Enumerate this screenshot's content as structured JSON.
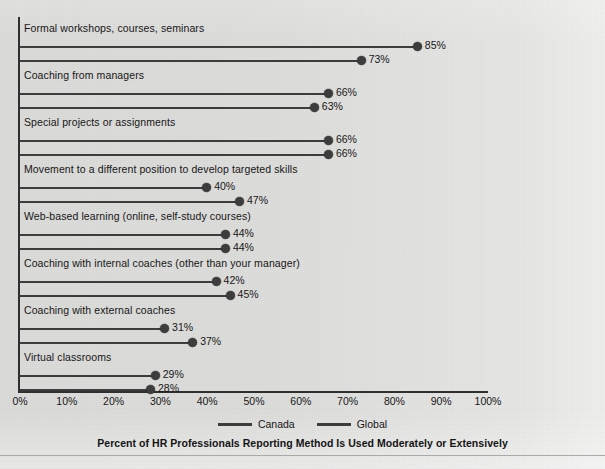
{
  "chart_data": {
    "type": "bar",
    "title": "Percent of HR Professionals Reporting Method Is Used Moderately or Extensively",
    "xlabel": "",
    "ylabel": "",
    "xlim": [
      0,
      100
    ],
    "grid": false,
    "legend_position": "bottom",
    "xticks": [
      "0%",
      "10%",
      "20%",
      "30%",
      "40%",
      "50%",
      "60%",
      "70%",
      "80%",
      "90%",
      "100%"
    ],
    "xtick_values": [
      0,
      10,
      20,
      30,
      40,
      50,
      60,
      70,
      80,
      90,
      100
    ],
    "categories": [
      "Formal workshops, courses, seminars",
      "Coaching from managers",
      "Special projects or assignments",
      "Movement to a different position to develop targeted skills",
      "Web-based learning (online, self-study courses)",
      "Coaching with internal coaches (other than your manager)",
      "Coaching with external coaches",
      "Virtual classrooms"
    ],
    "series": [
      {
        "name": "Canada",
        "color": "#3b3b3b",
        "values": [
          85,
          66,
          66,
          40,
          44,
          42,
          31,
          29
        ],
        "labels": [
          "85%",
          "66%",
          "66%",
          "40%",
          "44%",
          "42%",
          "31%",
          "29%"
        ]
      },
      {
        "name": "Global",
        "color": "#3b3b3b",
        "values": [
          73,
          63,
          66,
          47,
          44,
          45,
          37,
          28
        ],
        "labels": [
          "73%",
          "63%",
          "66%",
          "47%",
          "44%",
          "45%",
          "37%",
          "28%"
        ]
      }
    ]
  },
  "legend": {
    "items": [
      {
        "label": "Canada"
      },
      {
        "label": "Global"
      }
    ]
  }
}
